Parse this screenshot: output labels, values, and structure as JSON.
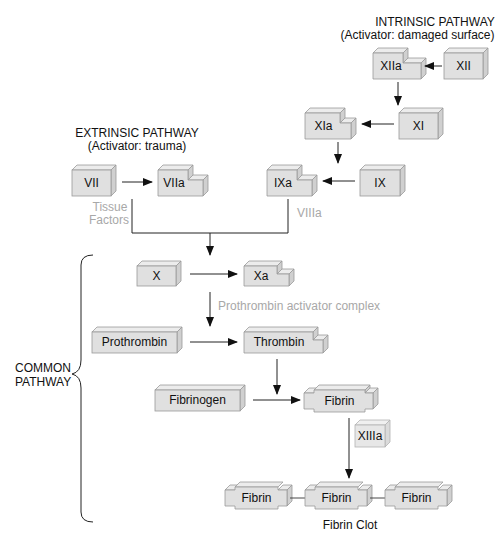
{
  "intrinsic": {
    "heading": "INTRINSIC PATHWAY",
    "activator": "(Activator: damaged surface)"
  },
  "extrinsic": {
    "heading": "EXTRINSIC PATHWAY",
    "activator": "(Activator: trauma)"
  },
  "common": {
    "label_line1": "COMMON",
    "label_line2": "PATHWAY"
  },
  "factors": {
    "XII": "XII",
    "XIIa": "XIIa",
    "XI": "XI",
    "XIa": "XIa",
    "IX": "IX",
    "IXa": "IXa",
    "VII": "VII",
    "VIIa": "VIIa",
    "X": "X",
    "Xa": "Xa",
    "prothrombin": "Prothrombin",
    "thrombin": "Thrombin",
    "fibrinogen": "Fibrinogen",
    "fibrin": "Fibrin",
    "XIIIa": "XIIIa"
  },
  "cofactors": {
    "tissue_factors_line1": "Tissue",
    "tissue_factors_line2": "Factors",
    "VIIIa": "VIIIa",
    "prothrombin_activator": "Prothrombin activator complex"
  },
  "clot": {
    "fibrin_1": "Fibrin",
    "fibrin_2": "Fibrin",
    "fibrin_3": "Fibrin",
    "caption": "Fibrin Clot"
  },
  "colors": {
    "box_fill": "#e0e0e0",
    "box_edge": "#9a9a9a",
    "cofactor_text": "#a8a8a8",
    "arrow": "#222222"
  }
}
